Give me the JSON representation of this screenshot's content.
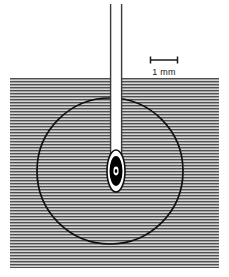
{
  "figure": {
    "background_color": "#ffffff"
  },
  "scale_bar": {
    "label": "1 mm",
    "x_start": 150,
    "x_end": 178,
    "y": 60,
    "tick_height": 7,
    "color": "#1a1a1a",
    "label_x": 164,
    "label_y": 74
  },
  "medium": {
    "name": "hatched-tissue-region",
    "x": 10,
    "y": 78,
    "width": 209,
    "height": 190,
    "fill_color": "#b8b8b8",
    "line_color": "#5a5a5a",
    "line_spacing": 3,
    "line_thickness": 1.4
  },
  "circle": {
    "name": "outer-lesion-boundary",
    "cx": 110,
    "cy": 171,
    "r": 73,
    "stroke_color": "#111111",
    "stroke_width": 1.6,
    "fill": "none"
  },
  "needle": {
    "name": "needle-shaft",
    "x_left": 110,
    "x_right": 122,
    "y_top": 4,
    "y_tip": 186,
    "shaft_fill": "#ffffff",
    "wall_color": "#3a3a3a",
    "wall_width": 1.3
  },
  "tip": {
    "name": "needle-tip-lesion-core",
    "cx": 116,
    "cy": 171,
    "outer_rx": 9,
    "outer_ry": 21,
    "outer_fill": "#ffffff",
    "outer_stroke": "#111111",
    "mid_rx": 6.5,
    "mid_ry": 15,
    "mid_fill": "#000000",
    "inner_rx": 2.4,
    "inner_ry": 4.2,
    "inner_fill": "#ffffff",
    "core_rx": 1.2,
    "core_ry": 2.0,
    "core_fill": "#000000"
  }
}
